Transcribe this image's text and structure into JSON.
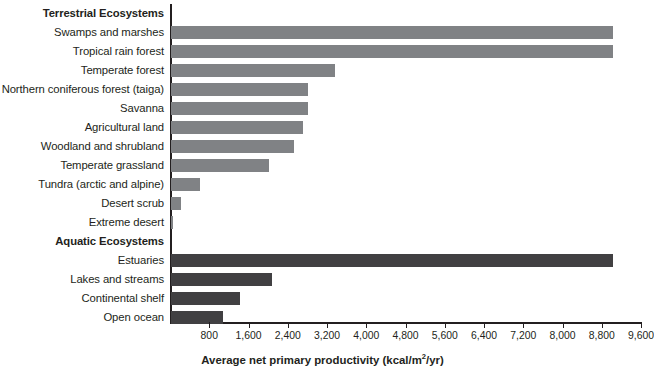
{
  "chart_data": {
    "type": "bar",
    "orientation": "horizontal",
    "title": "",
    "xlabel": "Average net primary productivity (kcal/m2/yr)",
    "xlabel_parts": {
      "pre": "Average net primary productivity (kcal/m",
      "sup": "2",
      "post": "/yr)"
    },
    "ylabel": "",
    "xlim": [
      0,
      9600
    ],
    "xticks": [
      800,
      1600,
      2400,
      3200,
      4000,
      4800,
      5600,
      6400,
      7200,
      8000,
      8800,
      9600
    ],
    "xtick_labels": [
      "800",
      "1,600",
      "2,400",
      "3,200",
      "4,000",
      "4,800",
      "5,600",
      "6,400",
      "7,200",
      "8,000",
      "8,800",
      "9,600"
    ],
    "grid": false,
    "legend": "none",
    "groups": [
      {
        "name": "Terrestrial Ecosystems",
        "color": "#808285",
        "categories": [
          "Swamps and marshes",
          "Tropical rain forest",
          "Temperate forest",
          "Northern coniferous forest (taiga)",
          "Savanna",
          "Agricultural land",
          "Woodland and shrubland",
          "Temperate grassland",
          "Tundra (arctic and alpine)",
          "Desert scrub",
          "Extreme desert"
        ],
        "values": [
          9000,
          9000,
          3350,
          2800,
          2800,
          2700,
          2500,
          2000,
          600,
          200,
          50
        ]
      },
      {
        "name": "Aquatic Ecosystems",
        "color": "#414042",
        "categories": [
          "Estuaries",
          "Lakes and streams",
          "Continental shelf",
          "Open ocean"
        ],
        "values": [
          9000,
          2050,
          1400,
          1050
        ]
      }
    ]
  },
  "rows": [
    {
      "label": "Terrestrial Ecosystems",
      "type": "group",
      "value": null,
      "class": ""
    },
    {
      "label": "Swamps and marshes",
      "type": "bar",
      "value": 9000,
      "class": "terrestrial"
    },
    {
      "label": "Tropical rain forest",
      "type": "bar",
      "value": 9000,
      "class": "terrestrial"
    },
    {
      "label": "Temperate forest",
      "type": "bar",
      "value": 3350,
      "class": "terrestrial"
    },
    {
      "label": "Northern coniferous forest (taiga)",
      "type": "bar",
      "value": 2800,
      "class": "terrestrial"
    },
    {
      "label": "Savanna",
      "type": "bar",
      "value": 2800,
      "class": "terrestrial"
    },
    {
      "label": "Agricultural land",
      "type": "bar",
      "value": 2700,
      "class": "terrestrial"
    },
    {
      "label": "Woodland and shrubland",
      "type": "bar",
      "value": 2500,
      "class": "terrestrial"
    },
    {
      "label": "Temperate grassland",
      "type": "bar",
      "value": 2000,
      "class": "terrestrial"
    },
    {
      "label": "Tundra (arctic and alpine)",
      "type": "bar",
      "value": 600,
      "class": "terrestrial"
    },
    {
      "label": "Desert scrub",
      "type": "bar",
      "value": 200,
      "class": "terrestrial"
    },
    {
      "label": "Extreme desert",
      "type": "bar",
      "value": 50,
      "class": "terrestrial"
    },
    {
      "label": "Aquatic Ecosystems",
      "type": "group",
      "value": null,
      "class": ""
    },
    {
      "label": "Estuaries",
      "type": "bar",
      "value": 9000,
      "class": "aquatic"
    },
    {
      "label": "Lakes and streams",
      "type": "bar",
      "value": 2050,
      "class": "aquatic"
    },
    {
      "label": "Continental shelf",
      "type": "bar",
      "value": 1400,
      "class": "aquatic"
    },
    {
      "label": "Open ocean",
      "type": "bar",
      "value": 1050,
      "class": "aquatic"
    }
  ],
  "axis": {
    "title_pre": "Average net primary productivity (kcal/m",
    "title_sup": "2",
    "title_post": "/yr)"
  },
  "colors": {
    "terrestrial_bar": "#808285",
    "aquatic_bar": "#414042",
    "axis": "#231f20",
    "background": "#ffffff"
  }
}
